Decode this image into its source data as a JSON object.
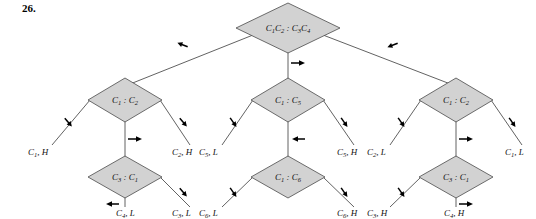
{
  "figure": {
    "number": "26.",
    "type": "decision-tree-diagram",
    "caption": ""
  },
  "colors": {
    "node_fill": "#d2d2d2",
    "node_stroke": "#4a4a4a",
    "branch_stroke": "#3a3a3a",
    "arrow": "#000000",
    "background": "#ffffff",
    "text": "#111111"
  },
  "tree": {
    "root": {
      "id": "root",
      "label": "C1C2 : C3C4",
      "label_parts": [
        "C",
        "1",
        "C",
        "2",
        " : ",
        "C",
        "3",
        "C",
        "4"
      ],
      "shape": "diamond",
      "x": 288,
      "y": 28
    },
    "level2": [
      {
        "id": "n-left",
        "label": "C1 : C2",
        "base": "C",
        "left_sub": "1",
        "right_base": "C",
        "right_sub": "2",
        "shape": "diamond",
        "x": 125,
        "y": 100
      },
      {
        "id": "n-mid",
        "label": "C1 : C5",
        "base": "C",
        "left_sub": "1",
        "right_base": "C",
        "right_sub": "5",
        "shape": "diamond",
        "x": 288,
        "y": 100
      },
      {
        "id": "n-right",
        "label": "C1 : C2",
        "base": "C",
        "left_sub": "1",
        "right_base": "C",
        "right_sub": "2",
        "shape": "diamond",
        "x": 456,
        "y": 100
      }
    ],
    "level3": [
      {
        "id": "n-left-lower",
        "label": "C3 : C1",
        "base": "C",
        "left_sub": "3",
        "right_base": "C",
        "right_sub": "1",
        "shape": "diamond",
        "x": 125,
        "y": 177
      },
      {
        "id": "n-mid-lower",
        "label": "C1 : C6",
        "base": "C",
        "left_sub": "1",
        "right_base": "C",
        "right_sub": "6",
        "shape": "diamond",
        "x": 288,
        "y": 177
      },
      {
        "id": "n-right-lower",
        "label": "C3 : C1",
        "base": "C",
        "left_sub": "3",
        "right_base": "C",
        "right_sub": "1",
        "shape": "diamond",
        "x": 456,
        "y": 177
      }
    ],
    "leaves": [
      {
        "id": "leaf-1",
        "label": "C1, H",
        "base": "C",
        "sub": "1",
        "tail": ", H",
        "x": 52,
        "y": 152
      },
      {
        "id": "leaf-2",
        "label": "C2, H",
        "base": "C",
        "sub": "2",
        "tail": ", H",
        "x": 180,
        "y": 152
      },
      {
        "id": "leaf-3",
        "label": "C4, L",
        "base": "C",
        "sub": "4",
        "tail": ", L",
        "x": 126,
        "y": 213
      },
      {
        "id": "leaf-4",
        "label": "C3, L",
        "base": "C",
        "sub": "3",
        "tail": ", L",
        "x": 180,
        "y": 213
      },
      {
        "id": "leaf-5",
        "label": "C5, L",
        "base": "C",
        "sub": "5",
        "tail": ", L",
        "x": 238,
        "y": 152
      },
      {
        "id": "leaf-6",
        "label": "C5, H",
        "base": "C",
        "sub": "5",
        "tail": ", H",
        "x": 345,
        "y": 152
      },
      {
        "id": "leaf-7",
        "label": "C6, L",
        "base": "C",
        "sub": "6",
        "tail": ", L",
        "x": 238,
        "y": 213
      },
      {
        "id": "leaf-8",
        "label": "C6, H",
        "base": "C",
        "sub": "6",
        "tail": ", H",
        "x": 345,
        "y": 213
      },
      {
        "id": "leaf-9",
        "label": "C2, L",
        "base": "C",
        "sub": "2",
        "tail": ", L",
        "x": 405,
        "y": 152
      },
      {
        "id": "leaf-10",
        "label": "C1, L",
        "base": "C",
        "sub": "1",
        "tail": ", L",
        "x": 512,
        "y": 152
      },
      {
        "id": "leaf-11",
        "label": "C3, H",
        "base": "C",
        "sub": "3",
        "tail": ", H",
        "x": 405,
        "y": 213
      },
      {
        "id": "leaf-12",
        "label": "C4, H",
        "base": "C",
        "sub": "4",
        "tail": ", H",
        "x": 458,
        "y": 213
      }
    ],
    "edge_markers": [
      {
        "id": "m-root-left",
        "kind": "arrow-left-shallow",
        "x": 183,
        "y": 48
      },
      {
        "id": "m-root-down",
        "kind": "arrow-right-horiz",
        "x": 300,
        "y": 63
      },
      {
        "id": "m-root-right",
        "kind": "arrow-left-shallow",
        "x": 393,
        "y": 48
      },
      {
        "id": "m-left-leftbranch",
        "kind": "arrow-up-steep",
        "x": 70,
        "y": 122
      },
      {
        "id": "m-left-rightbranch",
        "kind": "arrow-down-steep",
        "x": 180,
        "y": 122
      },
      {
        "id": "m-left-down",
        "kind": "arrow-right-horiz",
        "x": 137,
        "y": 141
      },
      {
        "id": "m-left-low-leaf",
        "kind": "arrow-left-horiz",
        "x": 115,
        "y": 205
      },
      {
        "id": "m-left-low-right",
        "kind": "arrow-down-steep",
        "x": 180,
        "y": 196
      },
      {
        "id": "m-mid-leftbranch",
        "kind": "arrow-up-steep",
        "x": 235,
        "y": 122
      },
      {
        "id": "m-mid-rightbranch",
        "kind": "arrow-down-steep",
        "x": 341,
        "y": 122
      },
      {
        "id": "m-mid-down",
        "kind": "arrow-left-horiz",
        "x": 300,
        "y": 141
      },
      {
        "id": "m-mid-low-left",
        "kind": "arrow-up-steep",
        "x": 235,
        "y": 196
      },
      {
        "id": "m-mid-low-right",
        "kind": "arrow-down-steep",
        "x": 341,
        "y": 196
      },
      {
        "id": "m-right-leftbranch",
        "kind": "arrow-up-steep",
        "x": 403,
        "y": 122
      },
      {
        "id": "m-right-rightbranch",
        "kind": "arrow-down-steep",
        "x": 510,
        "y": 122
      },
      {
        "id": "m-right-down",
        "kind": "arrow-right-horiz",
        "x": 468,
        "y": 141
      },
      {
        "id": "m-right-low-left",
        "kind": "arrow-up-steep",
        "x": 403,
        "y": 196
      },
      {
        "id": "m-right-low-leaf",
        "kind": "arrow-right-horiz",
        "x": 468,
        "y": 205
      }
    ]
  }
}
